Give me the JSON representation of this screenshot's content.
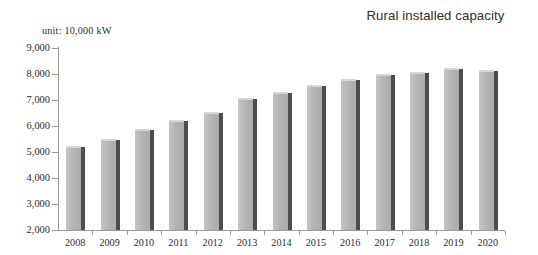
{
  "chart_data": {
    "type": "bar",
    "title": "Rural installed capacity",
    "unit_note": "unit: 10,000 kW",
    "xlabel": "",
    "ylabel": "",
    "ylim": [
      2000,
      9000
    ],
    "ytick_step": 1000,
    "ytick_labels": [
      "9,000",
      "8,000",
      "7,000",
      "6,000",
      "5,000",
      "4,000",
      "3,000",
      "2,000"
    ],
    "ytick_values": [
      9000,
      8000,
      7000,
      6000,
      5000,
      4000,
      3000,
      2000
    ],
    "grid": false,
    "legend": null,
    "categories": [
      "2008",
      "2009",
      "2010",
      "2011",
      "2012",
      "2013",
      "2014",
      "2015",
      "2016",
      "2017",
      "2018",
      "2019",
      "2020"
    ],
    "values": [
      5180,
      5480,
      5850,
      6180,
      6500,
      7050,
      7280,
      7550,
      7780,
      7950,
      8020,
      8180,
      8120
    ],
    "bar_face_color": "#b5b5b5",
    "bar_side_color": "#4d4d4d",
    "axis_color": "#9a9a9a",
    "text_color": "#2b2b2b",
    "background_color": "#ffffff"
  }
}
